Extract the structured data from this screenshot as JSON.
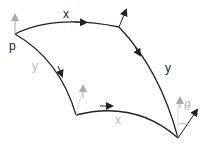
{
  "diagram": {
    "title": "",
    "point_label": "p",
    "edges": [
      {
        "id": "top",
        "label": "x",
        "label_color": "#222222"
      },
      {
        "id": "right",
        "label": "y",
        "label_color": "#222222"
      },
      {
        "id": "left",
        "label": "y",
        "label_color": "#bbbbbb"
      },
      {
        "id": "bottom",
        "label": "x",
        "label_color": "#bbbbbb"
      }
    ],
    "angle_label": "θ",
    "colors": {
      "dark": "#222222",
      "grey": "#aaaaaa",
      "background": "#ffffff"
    }
  }
}
